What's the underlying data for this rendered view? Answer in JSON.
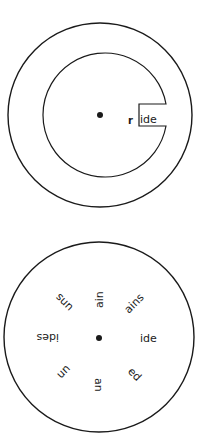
{
  "top_wheel": {
    "description": "Outer disc with inner rotating wheel and cut-out window",
    "window_prefix": "r",
    "window_word": "ide"
  },
  "bottom_wheel": {
    "description": "Word-ending wheel",
    "endings": [
      {
        "text": "ide",
        "angle": 0
      },
      {
        "text": "ed",
        "angle": 45
      },
      {
        "text": "an",
        "angle": 90
      },
      {
        "text": "un",
        "angle": 135
      },
      {
        "text": "ides",
        "angle": 180
      },
      {
        "text": "uns",
        "angle": 225
      },
      {
        "text": "ain",
        "angle": 270
      },
      {
        "text": "ains",
        "angle": 315
      }
    ]
  },
  "colors": {
    "line": "#1a1a1a",
    "background": "#ffffff"
  }
}
